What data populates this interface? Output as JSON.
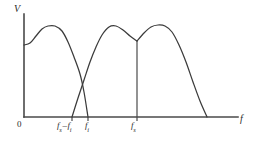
{
  "figure": {
    "background_color": "#ffffff",
    "axis_color": "#4a4a4a",
    "curve_color": "#3b3b3b"
  },
  "axes": {
    "y_label": "V",
    "x_label": "f",
    "origin_label": "0"
  },
  "ticks": [
    {
      "id": "fs-minus-fi",
      "base": "f",
      "subscript": "s",
      "operator": "–",
      "base2": "f",
      "subscript2": "i",
      "text": "f_s – f_i",
      "x": 72
    },
    {
      "id": "fi",
      "base": "f",
      "subscript": "i",
      "text": "f_i",
      "x": 88
    },
    {
      "id": "fs",
      "base": "f",
      "subscript": "s",
      "text": "f_s",
      "x": 137
    }
  ],
  "chart_data": {
    "type": "line",
    "xlabel": "f",
    "ylabel": "V",
    "grid": false,
    "legend": false,
    "xlim": [
      0,
      256
    ],
    "ylim": [
      0,
      147
    ],
    "axis_origin_px": {
      "x": 24,
      "y": 117
    },
    "tick_labels": [
      "0",
      "f_s – f_i",
      "f_i",
      "f_s"
    ],
    "tick_positions_px": [
      24,
      72,
      88,
      137
    ],
    "annotations": [
      {
        "id": "fs-vertical-marker",
        "type": "vertical-line",
        "x_px": 137,
        "y_top_px": 41,
        "y_bottom_px": 117,
        "label": "f_s"
      }
    ],
    "series": [
      {
        "name": "baseband-lobe",
        "description": "Input signal lobe starting at the V axis, peaking then falling to zero at f_i",
        "points_px": [
          [
            24,
            45
          ],
          [
            30,
            43
          ],
          [
            36,
            36
          ],
          [
            42,
            29
          ],
          [
            48,
            26
          ],
          [
            55,
            26
          ],
          [
            62,
            31
          ],
          [
            68,
            42
          ],
          [
            74,
            57
          ],
          [
            80,
            74
          ],
          [
            84,
            92
          ],
          [
            88,
            117
          ]
        ]
      },
      {
        "name": "alias-lobe",
        "description": "Alias lobe rising from zero at f_s minus f_i up to a peak and down to a local minimum at f_s",
        "points_px": [
          [
            72,
            117
          ],
          [
            78,
            98
          ],
          [
            84,
            80
          ],
          [
            90,
            62
          ],
          [
            96,
            47
          ],
          [
            102,
            35
          ],
          [
            109,
            27
          ],
          [
            116,
            26
          ],
          [
            123,
            30
          ],
          [
            130,
            36
          ],
          [
            137,
            41
          ]
        ]
      },
      {
        "name": "sampled-upper-lobe",
        "description": "Upper sideband lobe rising from the local minimum at f_s to a peak and falling to zero",
        "points_px": [
          [
            137,
            41
          ],
          [
            144,
            33
          ],
          [
            151,
            27
          ],
          [
            158,
            25
          ],
          [
            165,
            26
          ],
          [
            172,
            32
          ],
          [
            179,
            45
          ],
          [
            186,
            62
          ],
          [
            193,
            82
          ],
          [
            200,
            101
          ],
          [
            207,
            117
          ]
        ]
      }
    ]
  }
}
